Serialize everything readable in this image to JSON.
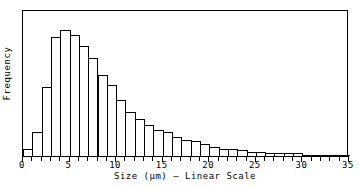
{
  "chart_data": {
    "type": "bar",
    "title": "",
    "subtitle": "",
    "xlabel": "Size (μm) – Linear Scale",
    "ylabel": "Frequency",
    "xlim": [
      0,
      35
    ],
    "ylim": [
      0,
      100
    ],
    "grid": false,
    "legend": null,
    "bin_width": 1,
    "xticks": [
      0,
      5,
      10,
      15,
      20,
      25,
      30,
      35
    ],
    "xtick_labels": [
      "0",
      "5",
      "10",
      "15",
      "20",
      "25",
      "30",
      "35"
    ],
    "yticks": [],
    "ytick_labels": [],
    "minor_xtick_interval": 1,
    "categories": [
      "0-1",
      "1-2",
      "2-3",
      "3-4",
      "4-5",
      "5-6",
      "6-7",
      "7-8",
      "8-9",
      "9-10",
      "10-11",
      "11-12",
      "12-13",
      "13-14",
      "14-15",
      "15-16",
      "16-17",
      "17-18",
      "18-19",
      "19-20",
      "20-21",
      "21-22",
      "22-23",
      "23-24",
      "24-25",
      "25-26",
      "26-27",
      "27-28",
      "28-29",
      "29-30",
      "30-31",
      "31-32",
      "32-33",
      "33-34",
      "34-35"
    ],
    "bin_starts": [
      0,
      1,
      2,
      3,
      4,
      5,
      6,
      7,
      8,
      9,
      10,
      11,
      12,
      13,
      14,
      15,
      16,
      17,
      18,
      19,
      20,
      21,
      22,
      23,
      24,
      25,
      26,
      27,
      28,
      29,
      30,
      31,
      32,
      33,
      34
    ],
    "values": [
      5,
      16,
      47,
      81,
      86,
      82,
      75,
      67,
      55,
      48,
      38,
      30,
      25,
      21,
      18,
      16,
      13,
      11,
      10,
      8,
      6,
      5,
      5,
      4,
      3,
      3,
      2,
      2,
      2,
      2,
      1,
      1,
      1,
      1,
      1
    ],
    "series": [
      {
        "name": "Frequency",
        "values": [
          5,
          16,
          47,
          81,
          86,
          82,
          75,
          67,
          55,
          48,
          38,
          30,
          25,
          21,
          18,
          16,
          13,
          11,
          10,
          8,
          6,
          5,
          5,
          4,
          3,
          3,
          2,
          2,
          2,
          2,
          1,
          1,
          1,
          1,
          1
        ]
      }
    ],
    "colors": {
      "bar_fill": "#ffffff",
      "bar_edge": "#000000",
      "axis": "#000000",
      "text": "#000000",
      "background": "#ffffff"
    }
  }
}
